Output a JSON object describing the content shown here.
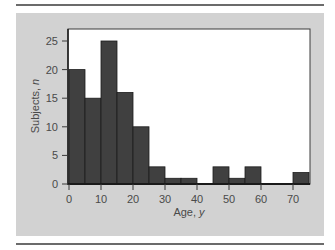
{
  "chart_data": {
    "type": "bar",
    "subtype": "histogram",
    "title": "",
    "xlabel": "Age, y",
    "ylabel": "Subjects, n",
    "bin_width": 5,
    "bins": [
      "0-5",
      "5-10",
      "10-15",
      "15-20",
      "20-25",
      "25-30",
      "30-35",
      "35-40",
      "40-45",
      "45-50",
      "50-55",
      "55-60",
      "60-65",
      "65-70",
      "70-75"
    ],
    "bin_starts": [
      0,
      5,
      10,
      15,
      20,
      25,
      30,
      35,
      40,
      45,
      50,
      55,
      60,
      65,
      70
    ],
    "values": [
      20,
      15,
      25,
      16,
      10,
      3,
      1,
      1,
      0,
      3,
      1,
      3,
      0,
      0,
      2
    ],
    "xlim": [
      0,
      75
    ],
    "ylim": [
      0,
      27
    ],
    "xticks": [
      0,
      10,
      20,
      30,
      40,
      50,
      60,
      70
    ],
    "yticks": [
      0,
      5,
      10,
      15,
      20,
      25
    ],
    "grid": false,
    "legend": null,
    "bar_color": "#404040",
    "background_color": "#d2d2d2",
    "plot_background": "#ffffff"
  },
  "axes": {
    "x_title_main": "Age, ",
    "x_title_var": "y",
    "y_title_main": "Subjects, ",
    "y_title_var": "n"
  }
}
